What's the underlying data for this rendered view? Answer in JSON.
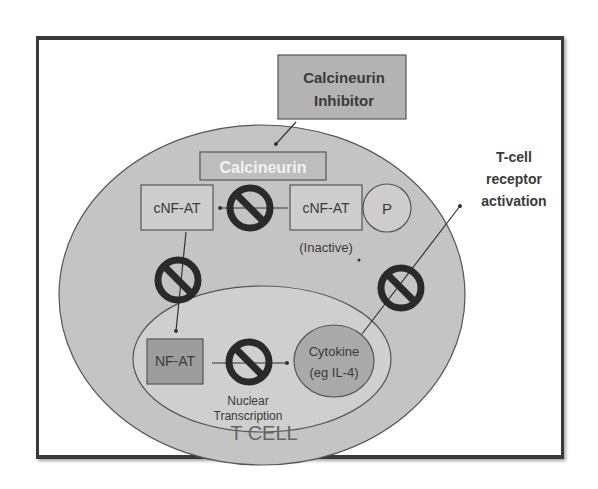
{
  "diagram": {
    "inhibitor_box": {
      "line1": "Calcineurin",
      "line2": "Inhibitor"
    },
    "calcineurin_box": {
      "label": "Calcineurin"
    },
    "cnfat_active": {
      "label": "cNF-AT"
    },
    "cnfat_inactive": {
      "label": "cNF-AT",
      "note": "(Inactive)"
    },
    "phosphate": {
      "label": "P"
    },
    "nfat_box": {
      "label": "NF-AT"
    },
    "cytokine": {
      "line1": "Cytokine",
      "line2": "(eg IL-4)"
    },
    "nuclear_transcription": {
      "line1": "Nuclear",
      "line2": "Transcription"
    },
    "tcell_receptor": {
      "line1": "T-cell",
      "line2": "receptor",
      "line3": "activation"
    },
    "cell_label": "T CELL",
    "colors": {
      "cell_fill": "#c4c4c4",
      "nucleus_fill": "#cfcfcf",
      "box_fill": "#cdcdcd",
      "inhibitor_fill": "#b3b3b3",
      "nfat_fill": "#9d9d9d",
      "cytokine_fill": "#a9a9a9",
      "calcineurin_fill": "#bdbdbd",
      "outline": "#555555",
      "block_symbol": "#2a2a2a"
    }
  }
}
